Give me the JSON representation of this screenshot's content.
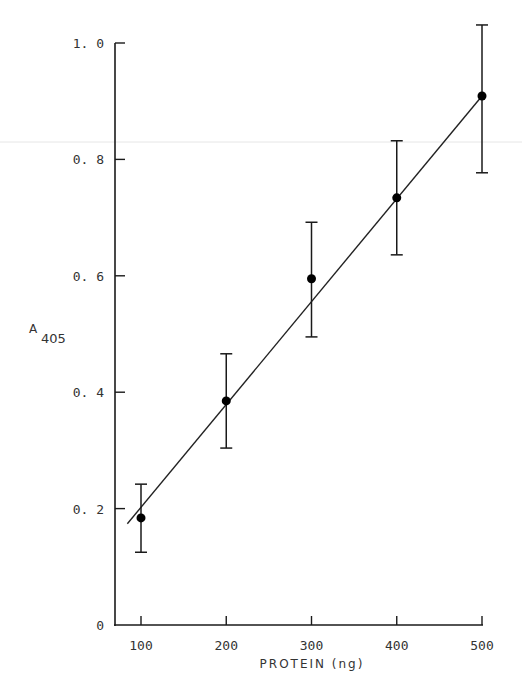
{
  "chart_data": {
    "type": "scatter",
    "title": "",
    "xlabel": "PROTEIN (ng)",
    "ylabel": "A",
    "ylabel_subscript": "405",
    "xlim": [
      70,
      500
    ],
    "ylim": [
      0,
      1.0
    ],
    "x_ticks": [
      100,
      200,
      300,
      400,
      500
    ],
    "x_tick_labels": [
      "100",
      "200",
      "300",
      "400",
      "500"
    ],
    "y_ticks": [
      0,
      0.2,
      0.4,
      0.6,
      0.8,
      1.0
    ],
    "y_tick_labels": [
      "0",
      "0.2",
      "0.4",
      "0.6",
      "0.8",
      "1.0"
    ],
    "grid": false,
    "legend": null,
    "series": [
      {
        "name": "A405 vs protein",
        "marker": "filled-circle",
        "x": [
          100,
          200,
          300,
          400,
          500
        ],
        "y": [
          0.184,
          0.385,
          0.595,
          0.734,
          0.909
        ],
        "error_upper": [
          0.242,
          0.466,
          0.692,
          0.832,
          1.031
        ],
        "error_lower": [
          0.125,
          0.304,
          0.495,
          0.636,
          0.777
        ]
      }
    ],
    "fit_line": {
      "x": [
        84,
        500
      ],
      "y": [
        0.174,
        0.909
      ]
    }
  }
}
